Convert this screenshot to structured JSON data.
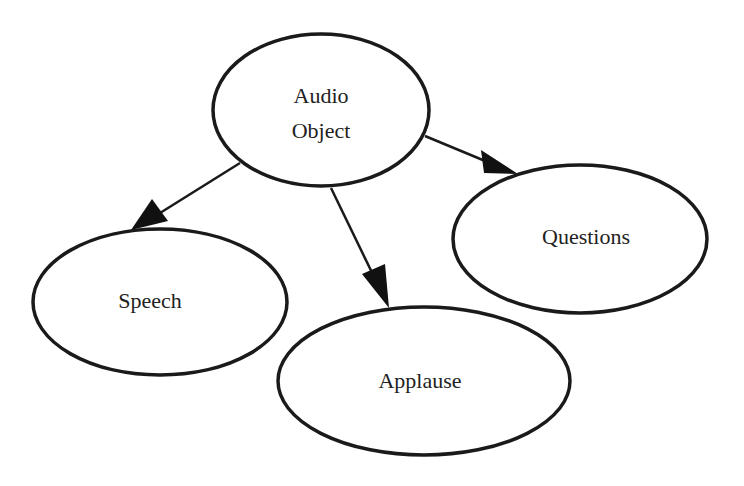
{
  "diagram": {
    "type": "directed-graph",
    "nodes": [
      {
        "id": "audio",
        "label_lines": [
          "Audio",
          "Object"
        ],
        "cx": 321,
        "cy": 110,
        "rx": 108,
        "ry": 76
      },
      {
        "id": "speech",
        "label_lines": [
          "Speech"
        ],
        "cx": 160,
        "cy": 302,
        "rx": 127,
        "ry": 73
      },
      {
        "id": "applause",
        "label_lines": [
          "Applause"
        ],
        "cx": 424,
        "cy": 381,
        "rx": 146,
        "ry": 74
      },
      {
        "id": "questions",
        "label_lines": [
          "Questions"
        ],
        "cx": 580,
        "cy": 239,
        "rx": 127,
        "ry": 74
      }
    ],
    "edges": [
      {
        "from": "audio",
        "to": "speech"
      },
      {
        "from": "audio",
        "to": "applause"
      },
      {
        "from": "audio",
        "to": "questions"
      }
    ]
  },
  "colors": {
    "stroke": "#1a1a1a",
    "text": "#222222",
    "background": "#ffffff"
  }
}
